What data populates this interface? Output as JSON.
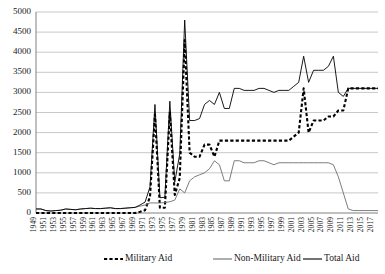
{
  "chart_data": {
    "type": "line",
    "title": "",
    "subtitle": "",
    "xlabel": "",
    "ylabel": "",
    "xlim": [
      1949,
      2018
    ],
    "ylim": [
      0,
      5000
    ],
    "ytick_step": 500,
    "xtick_step": 2,
    "grid": true,
    "legend_position": "bottom",
    "ytick_labels": [
      "0",
      "500",
      "1000",
      "1500",
      "2000",
      "2500",
      "3000",
      "3500",
      "4000",
      "4500",
      "5000"
    ],
    "ytick_values": [
      0,
      500,
      1000,
      1500,
      2000,
      2500,
      3000,
      3500,
      4000,
      4500,
      5000
    ],
    "xtick_labels": [
      "1949",
      "1951",
      "1953",
      "1955",
      "1957",
      "1959",
      "1961",
      "1963",
      "1965",
      "1967",
      "1969",
      "1971",
      "1973",
      "1975",
      "1977",
      "1979",
      "1981",
      "1983",
      "1985",
      "1987",
      "1989",
      "1991",
      "1993",
      "1995",
      "1997",
      "1999",
      "2001",
      "2003",
      "2005",
      "2007",
      "2009",
      "2011",
      "2013",
      "2015",
      "2017"
    ],
    "xtick_values": [
      1949,
      1951,
      1953,
      1955,
      1957,
      1959,
      1961,
      1963,
      1965,
      1967,
      1969,
      1971,
      1973,
      1975,
      1977,
      1979,
      1981,
      1983,
      1985,
      1987,
      1989,
      1991,
      1993,
      1995,
      1997,
      1999,
      2001,
      2003,
      2005,
      2007,
      2009,
      2011,
      2013,
      2015,
      2017
    ],
    "x": [
      1949,
      1950,
      1951,
      1952,
      1953,
      1954,
      1955,
      1956,
      1957,
      1958,
      1959,
      1960,
      1961,
      1962,
      1963,
      1964,
      1965,
      1966,
      1967,
      1968,
      1969,
      1970,
      1971,
      1972,
      1973,
      1974,
      1975,
      1976,
      1977,
      1978,
      1979,
      1980,
      1981,
      1982,
      1983,
      1984,
      1985,
      1986,
      1987,
      1988,
      1989,
      1990,
      1991,
      1992,
      1993,
      1994,
      1995,
      1996,
      1997,
      1998,
      1999,
      2000,
      2001,
      2002,
      2003,
      2004,
      2005,
      2006,
      2007,
      2008,
      2009,
      2010,
      2011,
      2012,
      2013,
      2014,
      2015,
      2016,
      2017,
      2018
    ],
    "series": [
      {
        "name": "Military Aid",
        "style": "dashed",
        "color": "#000000",
        "width": 2.1,
        "values": [
          0,
          0,
          0,
          0,
          0,
          0,
          0,
          0,
          0,
          0,
          0,
          0,
          0,
          0,
          0,
          0,
          0,
          0,
          0,
          0,
          0,
          30,
          70,
          400,
          2450,
          130,
          130,
          2500,
          450,
          870,
          4300,
          1500,
          1400,
          1400,
          1700,
          1700,
          1400,
          1800,
          1800,
          1800,
          1800,
          1800,
          1800,
          1800,
          1800,
          1800,
          1800,
          1800,
          1800,
          1800,
          1800,
          1800,
          1900,
          2000,
          3100,
          2000,
          2300,
          2300,
          2300,
          2400,
          2400,
          2550,
          2550,
          3100,
          3100,
          3100,
          3100,
          3100,
          3100,
          3100
        ]
      },
      {
        "name": "Non-Military Aid",
        "style": "solid",
        "color": "#6e6e6e",
        "width": 0.9,
        "values": [
          100,
          100,
          60,
          50,
          60,
          70,
          100,
          90,
          80,
          100,
          110,
          120,
          110,
          110,
          120,
          130,
          110,
          110,
          120,
          130,
          140,
          170,
          200,
          250,
          250,
          250,
          260,
          280,
          320,
          600,
          500,
          800,
          900,
          950,
          1000,
          1100,
          1300,
          1200,
          800,
          800,
          1300,
          1300,
          1250,
          1250,
          1250,
          1300,
          1300,
          1250,
          1200,
          1250,
          1250,
          1250,
          1250,
          1250,
          1250,
          1250,
          1250,
          1250,
          1250,
          1250,
          1200,
          900,
          500,
          100,
          60,
          60,
          60,
          60,
          60,
          60
        ]
      },
      {
        "name": "Total Aid",
        "style": "solid",
        "color": "#000000",
        "width": 0.9,
        "values": [
          100,
          100,
          60,
          50,
          60,
          70,
          100,
          90,
          80,
          100,
          110,
          120,
          110,
          110,
          120,
          130,
          110,
          110,
          120,
          130,
          140,
          200,
          270,
          650,
          2700,
          380,
          390,
          2780,
          770,
          1470,
          4800,
          2300,
          2300,
          2350,
          2700,
          2800,
          2700,
          3000,
          2600,
          2600,
          3100,
          3100,
          3050,
          3050,
          3050,
          3100,
          3100,
          3050,
          3000,
          3050,
          3050,
          3050,
          3150,
          3250,
          3900,
          3250,
          3550,
          3550,
          3550,
          3650,
          3900,
          3000,
          2900,
          3100,
          3100,
          3100,
          3100,
          3100,
          3100,
          3100
        ]
      }
    ],
    "legend": [
      {
        "label": "Military Aid",
        "style": "dashed",
        "color": "#000000"
      },
      {
        "label": "Non-Military Aid",
        "style": "solid",
        "color": "#6e6e6e"
      },
      {
        "label": "Total Aid",
        "style": "solid",
        "color": "#000000"
      }
    ]
  }
}
